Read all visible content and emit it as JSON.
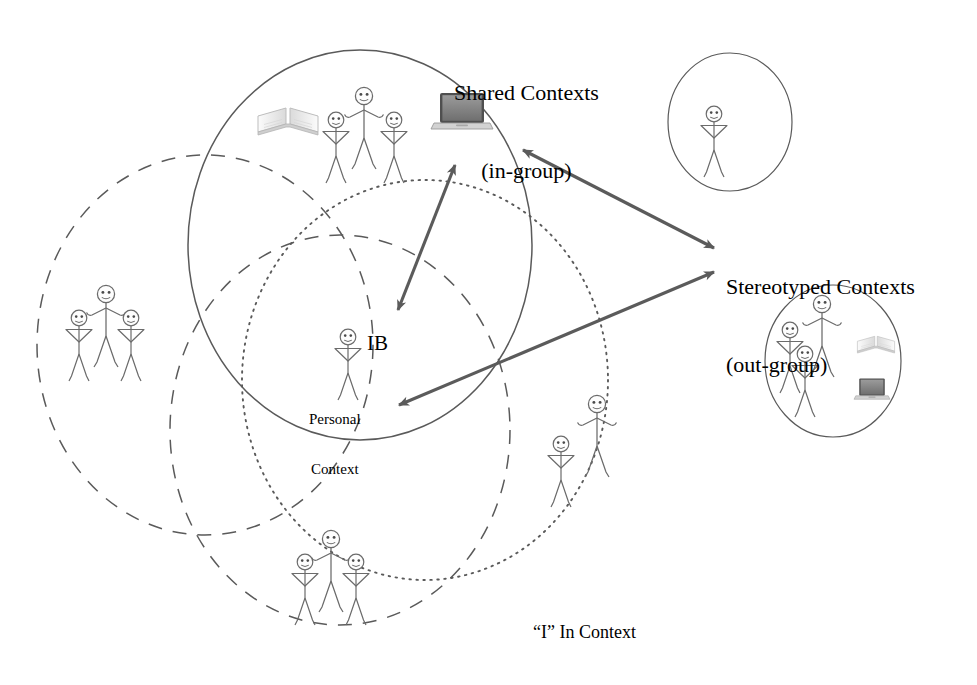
{
  "diagram": {
    "title_caption": "“I” In Context",
    "labels": {
      "shared_line1": "Shared Contexts",
      "shared_line2": "(in-group)",
      "stereotyped_line1": "Stereotyped Contexts",
      "stereotyped_line2": "(out-group)",
      "self_label": "IB",
      "personal_line1": "Personal",
      "personal_line2": "Context"
    },
    "colors": {
      "stroke": "#5a5a5a",
      "arrow": "#5b5b5b",
      "figure": "#6b6b6b",
      "text": "#111111",
      "background": "#ffffff",
      "laptop_screen": "#8d8d8d",
      "book_page": "#e8e8e8"
    },
    "circles": [
      {
        "name": "shared-contexts-circle",
        "style": "solid",
        "cx": 360,
        "cy": 245,
        "rx": 172,
        "ry": 195
      },
      {
        "name": "left-context-circle",
        "style": "dashed",
        "cx": 205,
        "cy": 345,
        "rx": 168,
        "ry": 190
      },
      {
        "name": "bottom-context-circle",
        "style": "dashed",
        "cx": 340,
        "cy": 430,
        "rx": 170,
        "ry": 195
      },
      {
        "name": "personal-context-circle",
        "style": "dotted",
        "cx": 425,
        "cy": 380,
        "rx": 183,
        "ry": 200
      },
      {
        "name": "stereotype-single-circle",
        "style": "solid",
        "cx": 730,
        "cy": 122,
        "rx": 62,
        "ry": 69
      },
      {
        "name": "stereotype-group-circle",
        "style": "solid",
        "cx": 833,
        "cy": 361,
        "rx": 68,
        "ry": 76
      }
    ],
    "arrows": [
      {
        "name": "arrow-self-to-shared",
        "double_headed": true,
        "from": [
          398,
          310
        ],
        "to": [
          455,
          165
        ]
      },
      {
        "name": "arrow-shared-to-stereotyped",
        "double_headed": true,
        "from": [
          520,
          148
        ],
        "to": [
          716,
          248
        ]
      },
      {
        "name": "arrow-self-to-stereotyped",
        "double_headed": true,
        "from": [
          396,
          406
        ],
        "to": [
          716,
          272
        ]
      }
    ],
    "figure_groups": [
      {
        "name": "shared-contexts-people",
        "count": 3,
        "arrangement": "triad"
      },
      {
        "name": "left-context-people",
        "count": 3,
        "arrangement": "triad"
      },
      {
        "name": "bottom-context-people",
        "count": 3,
        "arrangement": "triad"
      },
      {
        "name": "personal-context-people",
        "count": 2,
        "arrangement": "pair"
      },
      {
        "name": "self-figure",
        "count": 1,
        "arrangement": "single"
      },
      {
        "name": "stereotype-single-person",
        "count": 1,
        "arrangement": "single"
      },
      {
        "name": "stereotype-group-people",
        "count": 3,
        "arrangement": "triad"
      }
    ],
    "objects": [
      {
        "name": "book-icon-shared",
        "kind": "open-book"
      },
      {
        "name": "laptop-icon-shared",
        "kind": "laptop"
      },
      {
        "name": "book-icon-stereotype",
        "kind": "open-book"
      },
      {
        "name": "laptop-icon-stereotype",
        "kind": "laptop"
      }
    ]
  }
}
